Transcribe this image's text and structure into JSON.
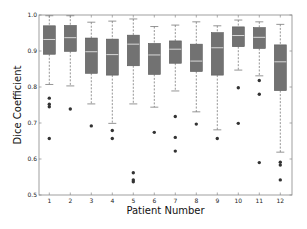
{
  "chart_data": {
    "type": "box",
    "title": "",
    "xlabel": "Patient Number",
    "ylabel": "Dice Coefficient",
    "ylim": [
      0.5,
      1.0
    ],
    "yticks": [
      "0.5",
      "0.6",
      "0.7",
      "0.8",
      "0.9",
      "1.0"
    ],
    "grid": false,
    "legend": null,
    "categories": [
      "1",
      "2",
      "3",
      "4",
      "5",
      "6",
      "7",
      "8",
      "9",
      "10",
      "11",
      "12"
    ],
    "boxes": [
      {
        "patient": "1",
        "whisker_low": 0.807,
        "q1": 0.891,
        "median": 0.932,
        "q3": 0.97,
        "whisker_high": 0.998,
        "outliers": [
          0.769,
          0.752,
          0.745,
          0.657
        ]
      },
      {
        "patient": "2",
        "whisker_low": 0.803,
        "q1": 0.899,
        "median": 0.937,
        "q3": 0.971,
        "whisker_high": 0.998,
        "outliers": [
          0.739
        ]
      },
      {
        "patient": "3",
        "whisker_low": 0.753,
        "q1": 0.838,
        "median": 0.898,
        "q3": 0.936,
        "whisker_high": 0.98,
        "outliers": [
          0.692
        ]
      },
      {
        "patient": "4",
        "whisker_low": 0.699,
        "q1": 0.833,
        "median": 0.89,
        "q3": 0.933,
        "whisker_high": 0.983,
        "outliers": [
          0.679,
          0.657
        ]
      },
      {
        "patient": "5",
        "whisker_low": 0.753,
        "q1": 0.859,
        "median": 0.919,
        "q3": 0.944,
        "whisker_high": 0.989,
        "outliers": [
          0.562,
          0.542,
          0.537
        ]
      },
      {
        "patient": "6",
        "whisker_low": 0.744,
        "q1": 0.835,
        "median": 0.889,
        "q3": 0.921,
        "whisker_high": 0.968,
        "outliers": [
          0.674
        ]
      },
      {
        "patient": "7",
        "whisker_low": 0.789,
        "q1": 0.866,
        "median": 0.905,
        "q3": 0.928,
        "whisker_high": 0.972,
        "outliers": [
          0.718,
          0.66,
          0.622
        ]
      },
      {
        "patient": "8",
        "whisker_low": 0.731,
        "q1": 0.843,
        "median": 0.872,
        "q3": 0.919,
        "whisker_high": 0.981,
        "outliers": [
          0.697
        ]
      },
      {
        "patient": "9",
        "whisker_low": 0.681,
        "q1": 0.833,
        "median": 0.909,
        "q3": 0.951,
        "whisker_high": 0.97,
        "outliers": [
          0.657
        ]
      },
      {
        "patient": "10",
        "whisker_low": 0.847,
        "q1": 0.912,
        "median": 0.943,
        "q3": 0.967,
        "whisker_high": 0.986,
        "outliers": [
          0.798,
          0.699
        ]
      },
      {
        "patient": "11",
        "whisker_low": 0.831,
        "q1": 0.907,
        "median": 0.938,
        "q3": 0.965,
        "whisker_high": 0.981,
        "outliers": [
          0.818,
          0.78,
          0.59
        ]
      },
      {
        "patient": "12",
        "whisker_low": 0.619,
        "q1": 0.79,
        "median": 0.87,
        "q3": 0.917,
        "whisker_high": 0.974,
        "outliers": [
          0.591,
          0.583,
          0.542
        ]
      }
    ],
    "colors": {
      "box_fill": "#727272",
      "box_edge": "#5a5a5a",
      "median": "#d8d8d8",
      "whisker": "#7a7a7a",
      "outlier": "#333333",
      "axis": "#888888"
    }
  }
}
